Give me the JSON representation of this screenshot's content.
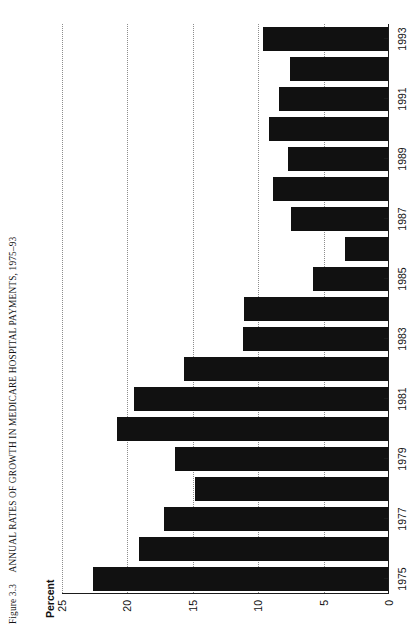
{
  "caption": {
    "figure_number": "Figure 3.3",
    "title": "ANNUAL RATES OF GROWTH IN MEDICARE HOSPITAL PAYMENTS, 1975–93"
  },
  "axis_title": "Percent",
  "chart_data": {
    "type": "bar",
    "orientation": "horizontal",
    "title": "ANNUAL RATES OF GROWTH IN MEDICARE HOSPITAL PAYMENTS, 1975–93",
    "xlabel": "",
    "ylabel": "Percent",
    "ylim": [
      0,
      25
    ],
    "yticks": [
      0,
      5,
      10,
      15,
      20,
      25
    ],
    "ytick_labels": [
      "0",
      "5",
      "10",
      "15",
      "20",
      "25"
    ],
    "grid": true,
    "grid_axis": "value",
    "legend": false,
    "bar_color": "#111111",
    "categories": [
      "1975",
      "1976",
      "1977",
      "1978",
      "1979",
      "1980",
      "1981",
      "1982",
      "1983",
      "1984",
      "1985",
      "1986",
      "1987",
      "1988",
      "1989",
      "1990",
      "1991",
      "1992",
      "1993"
    ],
    "xtick_labels": [
      "1975",
      "1977",
      "1979",
      "1981",
      "1983",
      "1985",
      "1987",
      "1989",
      "1991",
      "1993"
    ],
    "values": [
      22.6,
      19.1,
      17.2,
      14.8,
      16.4,
      20.8,
      19.5,
      15.7,
      11.2,
      11.1,
      5.8,
      3.4,
      7.5,
      8.9,
      7.7,
      9.2,
      8.4,
      7.6,
      9.6
    ]
  }
}
